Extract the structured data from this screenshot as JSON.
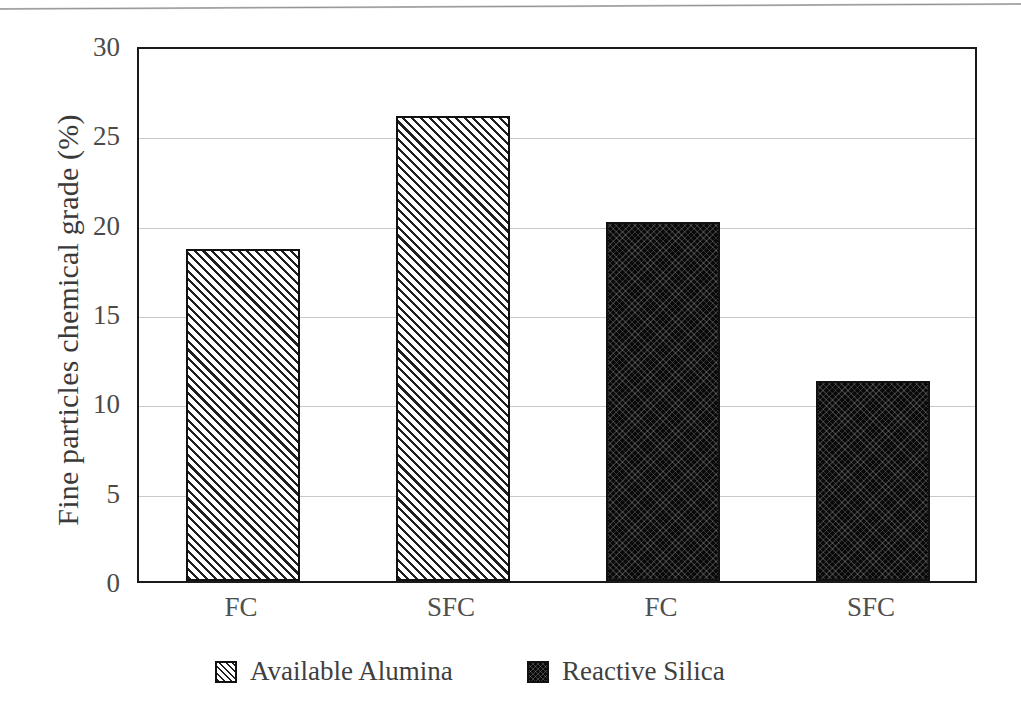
{
  "chart_data": {
    "type": "bar",
    "title": "",
    "subtitle": "",
    "xlabel": "",
    "ylabel": "Fine particles chemical grade (%)",
    "categories": [
      "FC",
      "SFC",
      "FC",
      "SFC"
    ],
    "series": [
      {
        "name": "Available Alumina",
        "values": [
          18.6,
          26.0,
          null,
          null
        ]
      },
      {
        "name": "Reactive Silica",
        "values": [
          null,
          null,
          20.1,
          11.2
        ]
      }
    ],
    "bars": [
      {
        "category": "FC",
        "series": "Available Alumina",
        "value": 18.6
      },
      {
        "category": "SFC",
        "series": "Available Alumina",
        "value": 26.0
      },
      {
        "category": "FC",
        "series": "Reactive Silica",
        "value": 20.1
      },
      {
        "category": "SFC",
        "series": "Reactive Silica",
        "value": 11.2
      }
    ],
    "ylim": [
      0,
      30
    ],
    "ytick_step": 5,
    "yticks": [
      "30",
      "25",
      "20",
      "15",
      "10",
      "5",
      "0"
    ],
    "xticks": [
      "FC",
      "SFC",
      "FC",
      "SFC"
    ],
    "grid": "horizontal",
    "legend_position": "bottom",
    "legend": [
      {
        "label": "Available Alumina",
        "pattern": "diagonal-hatch",
        "color": "#ffffff"
      },
      {
        "label": "Reactive Silica",
        "pattern": "dark-cross-hatch",
        "color": "#090909"
      }
    ],
    "colors": {
      "axis": "#1a1a1a",
      "gridline": "#c9c9c9",
      "text": "#3f3f3f",
      "alumina_fill": "#ffffff",
      "silica_fill": "#090909"
    }
  }
}
